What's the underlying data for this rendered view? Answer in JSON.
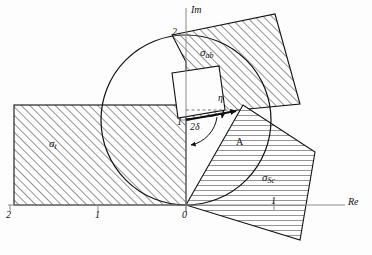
{
  "figure": {
    "background_color": "#fdfdfd",
    "line_color": "#111111",
    "axis_color": "#8a8a8a",
    "hatch_color": "#2a2a2a",
    "width": 372,
    "height": 255
  },
  "axes": {
    "imaginary": {
      "name": "Im",
      "x": 186,
      "top_y": 8,
      "bottom_y": 212
    },
    "real": {
      "name": "Re",
      "y": 205,
      "left_x": 8,
      "right_x": 345
    },
    "origin_label": "0",
    "real_ticks": [
      {
        "label": "2",
        "x": 10
      },
      {
        "label": "1",
        "x": 98
      },
      {
        "label": "0",
        "x": 186
      },
      {
        "label": "1",
        "x": 274
      }
    ],
    "imaginary_ticks": [
      {
        "label": "1",
        "y": 120
      },
      {
        "label": "2",
        "y": 35
      }
    ]
  },
  "regions": [
    {
      "id": "sigma-t",
      "label": "σ",
      "subscript": "t",
      "hatch": "diagonal",
      "label_x": 55,
      "label_y": 143
    },
    {
      "id": "sigma-ab",
      "label": "σ",
      "subscript": "ab",
      "hatch": "diagonal",
      "label_x": 207,
      "label_y": 52
    },
    {
      "id": "sigma-sc",
      "label": "σ",
      "subscript": "Sc",
      "hatch": "horizontal",
      "label_x": 269,
      "label_y": 178
    }
  ],
  "annotations": [
    {
      "id": "eta",
      "label": "η",
      "x": 221,
      "y": 98
    },
    {
      "id": "two-delta",
      "label": "2δ",
      "x": 196,
      "y": 127
    },
    {
      "id": "amplitude",
      "label": "A",
      "x": 240,
      "y": 143
    }
  ],
  "circle": {
    "center_x": 186,
    "center_y": 120,
    "radius": 85
  },
  "vector": {
    "from_x": 186,
    "from_y": 120,
    "to_x": 238,
    "to_y": 110
  }
}
